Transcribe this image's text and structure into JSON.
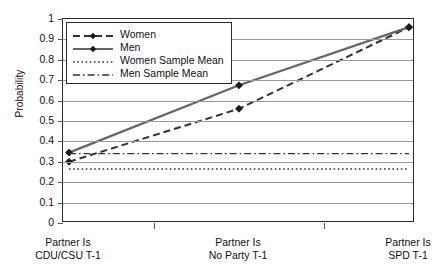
{
  "chart_data": {
    "type": "line",
    "title": "",
    "xlabel": "",
    "ylabel": "Probability",
    "ylim": [
      0,
      1
    ],
    "ytick_labels": [
      "1",
      "0.9",
      "0.8",
      "0.7",
      "0.6",
      "0.5",
      "0.4",
      "0.3",
      "0.2",
      "0.1",
      "0"
    ],
    "ytick_values": [
      1,
      0.9,
      0.8,
      0.7,
      0.6,
      0.5,
      0.4,
      0.3,
      0.2,
      0.1,
      0
    ],
    "grid": true,
    "legend_position": "upper-left-inside",
    "categories": [
      "Partner Is CDU/CSU T-1",
      "Partner Is No Party T-1",
      "Partner Is SPD T-1"
    ],
    "category_lines": [
      [
        "Partner Is",
        "CDU/CSU T-1"
      ],
      [
        "Partner Is",
        "No Party T-1"
      ],
      [
        "Partner Is",
        "SPD T-1"
      ]
    ],
    "series": [
      {
        "name": "Women",
        "style": "dashed",
        "marker": "diamond",
        "color": "#333333",
        "values": [
          0.3,
          0.56,
          0.96
        ]
      },
      {
        "name": "Men",
        "style": "solid",
        "marker": "diamond",
        "color": "#666666",
        "values": [
          0.345,
          0.675,
          0.96
        ]
      },
      {
        "name": "Women Sample Mean",
        "style": "dotted",
        "marker": "none",
        "color": "#333333",
        "values": [
          0.265,
          0.265,
          0.265
        ]
      },
      {
        "name": "Men Sample Mean",
        "style": "dashdot",
        "marker": "none",
        "color": "#333333",
        "values": [
          0.34,
          0.34,
          0.34
        ]
      }
    ]
  },
  "legend": {
    "entries": [
      {
        "label": "Women"
      },
      {
        "label": "Men"
      },
      {
        "label": "Women Sample Mean"
      },
      {
        "label": "Men Sample Mean"
      }
    ]
  }
}
